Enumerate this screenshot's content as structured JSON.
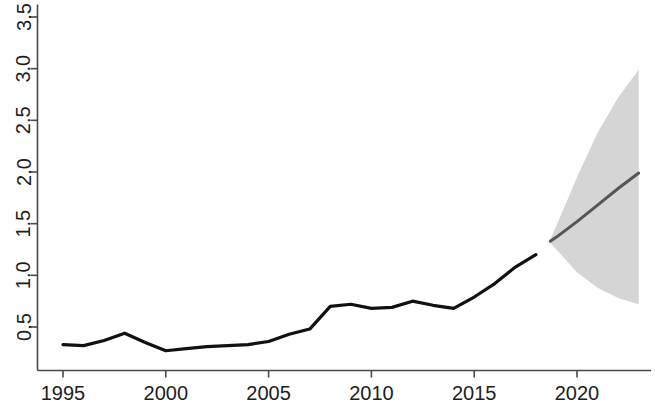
{
  "chart_data": {
    "type": "line",
    "title": "",
    "subtitle": "",
    "xlabel": "",
    "ylabel": "",
    "xlim": [
      1994.2,
      2023.5
    ],
    "ylim": [
      0.227,
      3.62
    ],
    "grid": false,
    "legend": "none",
    "x_ticks": [
      1995,
      2000,
      2005,
      2010,
      2015,
      2020
    ],
    "x_tick_labels": [
      "1995",
      "2000",
      "2005",
      "2010",
      "2015",
      "2020"
    ],
    "y_ticks": [
      0.5,
      1.0,
      1.5,
      2.0,
      2.5,
      3.0,
      3.5
    ],
    "y_tick_labels": [
      "0.5",
      "1.0",
      "1.5",
      "2.0",
      "2.5",
      "3.0",
      "3.5"
    ],
    "y_tick_label_rotation": -90,
    "series": [
      {
        "name": "observed",
        "type": "line",
        "color": "#111111",
        "x": [
          1995,
          1996,
          1997,
          1998,
          1999,
          2000,
          2001,
          2002,
          2003,
          2004,
          2005,
          2006,
          2007,
          2008,
          2009,
          2010,
          2011,
          2012,
          2013,
          2014,
          2015,
          2016,
          2017,
          2018
        ],
        "values": [
          0.33,
          0.32,
          0.37,
          0.44,
          0.35,
          0.27,
          0.29,
          0.31,
          0.32,
          0.33,
          0.36,
          0.43,
          0.48,
          0.7,
          0.72,
          0.68,
          0.69,
          0.75,
          0.71,
          0.68,
          0.79,
          0.92,
          1.08,
          1.2
        ]
      },
      {
        "name": "forecast-mean",
        "type": "line",
        "color": "#555555",
        "x": [
          2018.7,
          2019,
          2020,
          2021,
          2022,
          2023
        ],
        "values": [
          1.33,
          1.37,
          1.52,
          1.68,
          1.84,
          1.99
        ]
      }
    ],
    "forecast_band": {
      "name": "forecast-interval",
      "color": "#d3d3d3",
      "x": [
        2018.7,
        2019,
        2020,
        2021,
        2022,
        2023
      ],
      "upper": [
        1.35,
        1.48,
        1.95,
        2.38,
        2.72,
        2.99
      ],
      "lower": [
        1.31,
        1.25,
        1.03,
        0.88,
        0.78,
        0.72
      ]
    }
  }
}
